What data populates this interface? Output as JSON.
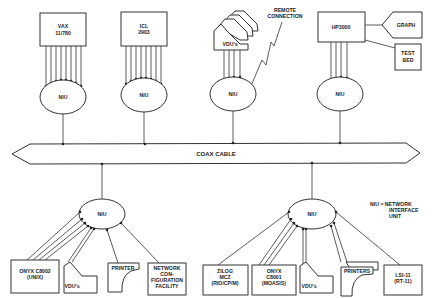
{
  "diagram": {
    "coax": {
      "label": "COAX CABLE"
    },
    "top_hosts": [
      {
        "id": "vax",
        "lines": [
          "VAX",
          "11/780"
        ],
        "niu": "NIU"
      },
      {
        "id": "icl",
        "lines": [
          "ICL",
          "2903"
        ],
        "niu": "NIU"
      },
      {
        "id": "vdu",
        "lines": [
          "VDU's"
        ],
        "niu": "NIU",
        "remote": [
          "REMOTE",
          "CONNECTION"
        ]
      },
      {
        "id": "hp",
        "lines": [
          "HP3000"
        ],
        "niu": "NIU",
        "peripherals": {
          "graph": "GRAPH",
          "testbed": [
            "TEST",
            "BED"
          ]
        }
      }
    ],
    "bottom_left": {
      "niu": "NIU",
      "devices": [
        {
          "id": "onyx-c8002",
          "lines": [
            "ONYX C8002",
            "(UNIX)"
          ]
        },
        {
          "id": "vdus",
          "lines": [
            "VDU's"
          ]
        },
        {
          "id": "printer",
          "lines": [
            "PRINTER"
          ]
        },
        {
          "id": "ncf",
          "lines": [
            "NETWORK",
            "CON-",
            "FIGURATION",
            "FACILITY"
          ]
        }
      ]
    },
    "bottom_right": {
      "niu": "NIU",
      "devices": [
        {
          "id": "zilog",
          "lines": [
            "ZILOG",
            "MCZ",
            "(RIO/CP/M)"
          ]
        },
        {
          "id": "onyx-c8001",
          "lines": [
            "ONYX",
            "C8001",
            "(MOASIS)"
          ]
        },
        {
          "id": "vdus",
          "lines": [
            "VDU's"
          ]
        },
        {
          "id": "printers",
          "lines": [
            "PRINTERS"
          ]
        },
        {
          "id": "lsi",
          "lines": [
            "LSI-11",
            "(RT-11)"
          ]
        }
      ]
    },
    "legend": {
      "lines": [
        "NIU  =  NETWORK",
        "INTERFACE",
        "UNIT"
      ]
    }
  }
}
